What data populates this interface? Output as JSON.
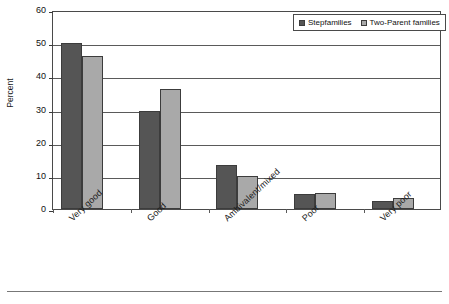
{
  "chart_data": {
    "type": "bar",
    "title": "",
    "subtitle": "",
    "xlabel": "",
    "ylabel": "Percent",
    "ylim": [
      0,
      60
    ],
    "ytick_step": 10,
    "yticks": [
      0,
      10,
      20,
      30,
      40,
      50,
      60
    ],
    "ytick_labels": [
      "0",
      "10",
      "20",
      "30",
      "40",
      "50",
      "60"
    ],
    "grid": true,
    "legend_position": "top-right",
    "categories": [
      "Very good",
      "Good",
      "Ambivalent/mixed",
      "Poor",
      "Very poor"
    ],
    "series": [
      {
        "name": "Stepfamilies",
        "color": "#555555",
        "values": [
          50.2,
          29.5,
          13.3,
          4.5,
          2.5
        ]
      },
      {
        "name": "Two-Parent families",
        "color": "#a9a9a9",
        "values": [
          46.0,
          36.2,
          9.9,
          4.9,
          3.2
        ]
      }
    ]
  },
  "legend": {
    "entries": [
      {
        "label": "Stepfamilies"
      },
      {
        "label": "Two-Parent families"
      }
    ]
  },
  "axes": {
    "y_title": "Percent"
  }
}
